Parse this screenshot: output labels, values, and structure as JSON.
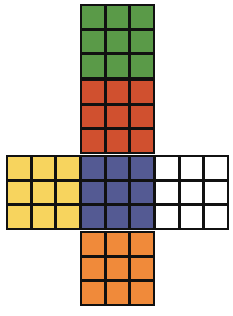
{
  "diagram": {
    "type": "cube-net",
    "faces": [
      {
        "id": "top-green",
        "color": "#5a9a48",
        "x": 80,
        "y": 4
      },
      {
        "id": "red",
        "color": "#d0502f",
        "x": 80,
        "y": 79
      },
      {
        "id": "left-yellow",
        "color": "#f7d45e",
        "x": 6,
        "y": 155
      },
      {
        "id": "center-blue",
        "color": "#545a93",
        "x": 80,
        "y": 155
      },
      {
        "id": "right-white",
        "color": "#ffffff",
        "x": 154,
        "y": 155
      },
      {
        "id": "bottom-orange",
        "color": "#f08a3a",
        "x": 80,
        "y": 231
      }
    ],
    "grid": "3x3"
  }
}
